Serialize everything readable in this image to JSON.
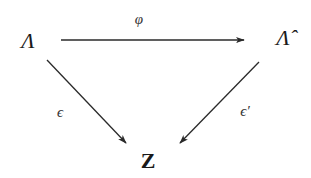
{
  "diagram": {
    "type": "commutative-diagram",
    "nodes": {
      "lambda": {
        "label": "Λ",
        "x": 28,
        "y": 41
      },
      "lambda_hat": {
        "label": "Λ̂",
        "x": 283,
        "y": 40
      },
      "z": {
        "label": "Z",
        "x": 148,
        "y": 161
      }
    },
    "arrows": {
      "phi": {
        "from": "lambda",
        "to": "lambda_hat",
        "label": "φ"
      },
      "epsilon": {
        "from": "lambda",
        "to": "z",
        "label": "ϵ"
      },
      "epsilon_prime": {
        "from": "lambda_hat",
        "to": "z",
        "label": "ϵ′"
      }
    },
    "colors": {
      "stroke": "#2a2a2a",
      "text": "#1a1a1a",
      "background": "#ffffff"
    }
  }
}
